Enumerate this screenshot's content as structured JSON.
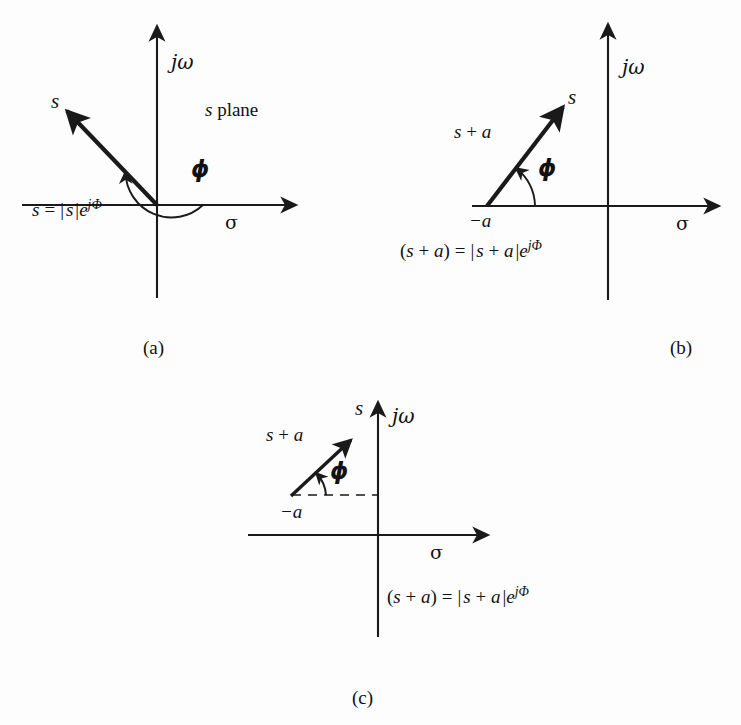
{
  "figure": {
    "background_color": "#fdfdfd",
    "ink_color": "#1a1a1a",
    "panel_count": 3
  },
  "panels": [
    {
      "id": "a",
      "caption": "(a)",
      "plane_label_s": "s",
      "plane_label_rest": " plane",
      "axis_imag": "jω",
      "axis_real": "σ",
      "vector_label": "s",
      "angle_label": "ϕ",
      "equation": {
        "lhs": "s",
        "equals": "=",
        "bar_open": "|",
        "magnitude": "s",
        "bar_close": "|",
        "exp_base": "e",
        "exp_sup": "jΦ",
        "full_text": "s = |s|e^{jΦ}"
      },
      "geometry": {
        "origin": [
          157,
          205
        ],
        "vector_tip": [
          60,
          104
        ],
        "vector_angle_deg": 134,
        "real_axis_from": [
          22,
          205
        ],
        "real_axis_to": [
          300,
          205
        ],
        "imag_axis_from": [
          157,
          298
        ],
        "imag_axis_to": [
          157,
          22
        ],
        "arc_radius": 46,
        "arc_start_deg": 0,
        "arc_end_deg": 134
      }
    },
    {
      "id": "b",
      "caption": "(b)",
      "axis_imag": "jω",
      "axis_real": "σ",
      "vector_label": "s",
      "vector_side_label_s": "s",
      "vector_side_label_plus": " + ",
      "vector_side_label_a": "a",
      "pole_label": "−a",
      "angle_label": "ϕ",
      "equation": {
        "full_text": "(s + a) = |s + a|e^{jΦ}",
        "lhs_open": "(",
        "lhs_s": "s",
        "lhs_plus": " + ",
        "lhs_a": "a",
        "lhs_close": ")",
        "equals": "=",
        "bar_open": "|",
        "mag_s": "s",
        "mag_plus": " + ",
        "mag_a": "a",
        "bar_close": "|",
        "exp_base": "e",
        "exp_sup": "jΦ"
      },
      "geometry": {
        "pole_point": [
          487,
          206
        ],
        "vector_tip": [
          568,
          100
        ],
        "vector_angle_deg": 52,
        "real_axis_from": [
          472,
          206
        ],
        "real_axis_to": [
          723,
          206
        ],
        "imag_axis_from": [
          608,
          300
        ],
        "imag_axis_to": [
          608,
          20
        ],
        "arc_radius": 48,
        "arc_start_deg": 0,
        "arc_end_deg": 52
      }
    },
    {
      "id": "c",
      "caption": "(c)",
      "axis_imag": "jω",
      "axis_real": "σ",
      "vector_label": "s",
      "vector_side_label_s": "s",
      "vector_side_label_plus": " + ",
      "vector_side_label_a": "a",
      "pole_label": "−a",
      "angle_label": "ϕ",
      "equation": {
        "full_text": "(s + a) = |s + a|e^{jΦ}",
        "lhs_open": "(",
        "lhs_s": "s",
        "lhs_plus": " + ",
        "lhs_a": "a",
        "lhs_close": ")",
        "equals": "=",
        "bar_open": "|",
        "mag_s": "s",
        "mag_plus": " + ",
        "mag_a": "a",
        "bar_close": "|",
        "exp_base": "e",
        "exp_sup": "jΦ"
      },
      "geometry": {
        "pole_point": [
          292,
          495
        ],
        "vector_tip": [
          352,
          435
        ],
        "vector_angle_deg": 45,
        "real_axis_from": [
          248,
          535
        ],
        "real_axis_to": [
          492,
          535
        ],
        "imag_axis_from": [
          378,
          637
        ],
        "imag_axis_to": [
          378,
          398
        ],
        "dashed_from": [
          292,
          495
        ],
        "dashed_to": [
          378,
          495
        ],
        "arc_radius": 34,
        "arc_start_deg": 0,
        "arc_end_deg": 45
      }
    }
  ]
}
